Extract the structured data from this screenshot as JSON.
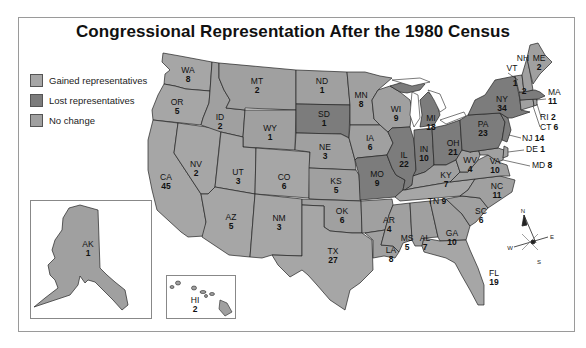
{
  "title": "Congressional Representation After the 1980 Census",
  "legend": [
    {
      "key": "gained",
      "label": "Gained representatives",
      "color": "#a4a4a4"
    },
    {
      "key": "lost",
      "label": "Lost representatives",
      "color": "#7a7a7a"
    },
    {
      "key": "nochange",
      "label": "No change",
      "color": "#9c9c9c"
    }
  ],
  "colors": {
    "gained": "#a6a6a6",
    "lost": "#7c7c7c",
    "nochange": "#a0a0a0",
    "water": "#ffffff",
    "border": "#222222"
  },
  "compass": {
    "n": "N",
    "s": "S",
    "e": "E",
    "w": "W"
  },
  "states": [
    {
      "abbr": "WA",
      "reps": "8",
      "status": "gained"
    },
    {
      "abbr": "OR",
      "reps": "5",
      "status": "gained"
    },
    {
      "abbr": "CA",
      "reps": "45",
      "status": "gained"
    },
    {
      "abbr": "NV",
      "reps": "2",
      "status": "gained"
    },
    {
      "abbr": "ID",
      "reps": "2",
      "status": "nochange"
    },
    {
      "abbr": "MT",
      "reps": "2",
      "status": "nochange"
    },
    {
      "abbr": "WY",
      "reps": "1",
      "status": "nochange"
    },
    {
      "abbr": "UT",
      "reps": "3",
      "status": "gained"
    },
    {
      "abbr": "AZ",
      "reps": "5",
      "status": "gained"
    },
    {
      "abbr": "CO",
      "reps": "6",
      "status": "gained"
    },
    {
      "abbr": "NM",
      "reps": "3",
      "status": "gained"
    },
    {
      "abbr": "ND",
      "reps": "1",
      "status": "nochange"
    },
    {
      "abbr": "SD",
      "reps": "1",
      "status": "lost"
    },
    {
      "abbr": "NE",
      "reps": "3",
      "status": "nochange"
    },
    {
      "abbr": "KS",
      "reps": "5",
      "status": "nochange"
    },
    {
      "abbr": "OK",
      "reps": "6",
      "status": "nochange"
    },
    {
      "abbr": "TX",
      "reps": "27",
      "status": "gained"
    },
    {
      "abbr": "MN",
      "reps": "8",
      "status": "nochange"
    },
    {
      "abbr": "IA",
      "reps": "6",
      "status": "nochange"
    },
    {
      "abbr": "MO",
      "reps": "9",
      "status": "lost"
    },
    {
      "abbr": "AR",
      "reps": "4",
      "status": "nochange"
    },
    {
      "abbr": "LA",
      "reps": "8",
      "status": "nochange"
    },
    {
      "abbr": "WI",
      "reps": "9",
      "status": "nochange"
    },
    {
      "abbr": "IL",
      "reps": "22",
      "status": "lost"
    },
    {
      "abbr": "MI",
      "reps": "18",
      "status": "lost"
    },
    {
      "abbr": "IN",
      "reps": "10",
      "status": "lost"
    },
    {
      "abbr": "OH",
      "reps": "21",
      "status": "lost"
    },
    {
      "abbr": "KY",
      "reps": "7",
      "status": "nochange"
    },
    {
      "abbr": "TN",
      "reps": "9",
      "status": "gained"
    },
    {
      "abbr": "MS",
      "reps": "5",
      "status": "nochange"
    },
    {
      "abbr": "AL",
      "reps": "7",
      "status": "nochange"
    },
    {
      "abbr": "GA",
      "reps": "10",
      "status": "nochange"
    },
    {
      "abbr": "FL",
      "reps": "19",
      "status": "gained"
    },
    {
      "abbr": "SC",
      "reps": "6",
      "status": "nochange"
    },
    {
      "abbr": "NC",
      "reps": "11",
      "status": "nochange"
    },
    {
      "abbr": "VA",
      "reps": "10",
      "status": "nochange"
    },
    {
      "abbr": "WV",
      "reps": "4",
      "status": "nochange"
    },
    {
      "abbr": "MD",
      "reps": "8",
      "status": "nochange"
    },
    {
      "abbr": "DE",
      "reps": "1",
      "status": "nochange"
    },
    {
      "abbr": "PA",
      "reps": "23",
      "status": "lost"
    },
    {
      "abbr": "NJ",
      "reps": "14",
      "status": "lost"
    },
    {
      "abbr": "NY",
      "reps": "34",
      "status": "lost"
    },
    {
      "abbr": "CT",
      "reps": "6",
      "status": "nochange"
    },
    {
      "abbr": "RI",
      "reps": "2",
      "status": "nochange"
    },
    {
      "abbr": "MA",
      "reps": "11",
      "status": "lost"
    },
    {
      "abbr": "VT",
      "reps": "1",
      "status": "nochange"
    },
    {
      "abbr": "NH",
      "reps": "2",
      "status": "nochange"
    },
    {
      "abbr": "ME",
      "reps": "2",
      "status": "nochange"
    },
    {
      "abbr": "AK",
      "reps": "1",
      "status": "nochange"
    },
    {
      "abbr": "HI",
      "reps": "2",
      "status": "nochange"
    }
  ]
}
